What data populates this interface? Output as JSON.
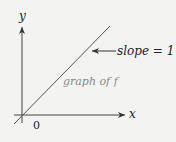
{
  "diagram": {
    "axes": {
      "x_label": "x",
      "y_label": "y",
      "origin_label": "0"
    },
    "line": {
      "label": "graph of f",
      "label_color": "#8a8a8a"
    },
    "annotation": {
      "text": "slope = 1",
      "arrow_direction": "left"
    },
    "colors": {
      "background": "#f3f3f2",
      "axis": "#333333",
      "line": "#555555"
    }
  }
}
